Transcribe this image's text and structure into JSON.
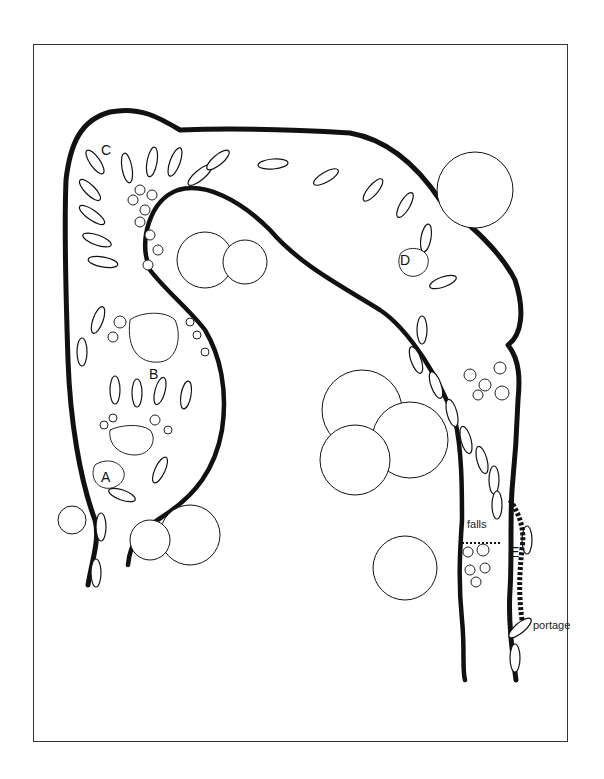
{
  "diagram": {
    "type": "river-route-illustration",
    "labels": {
      "A": "A",
      "B": "B",
      "C": "C",
      "D": "D",
      "E": "E",
      "falls": "falls",
      "portage": "portage"
    },
    "colors": {
      "ink": "#111111",
      "background": "#ffffff",
      "frame": "#333333"
    },
    "elements": {
      "river_channel": "U-shaped river bend flowing from bottom-left up, across the top, and down the right side",
      "boats": "canoe/kayak silhouettes marking the paddling line",
      "rocks": "rock clusters at B, C, D and below falls",
      "bushes": "shoreline vegetation clumps",
      "falls": "waterfall on the right channel",
      "portage": "portage trail around the falls on the right bank"
    }
  }
}
